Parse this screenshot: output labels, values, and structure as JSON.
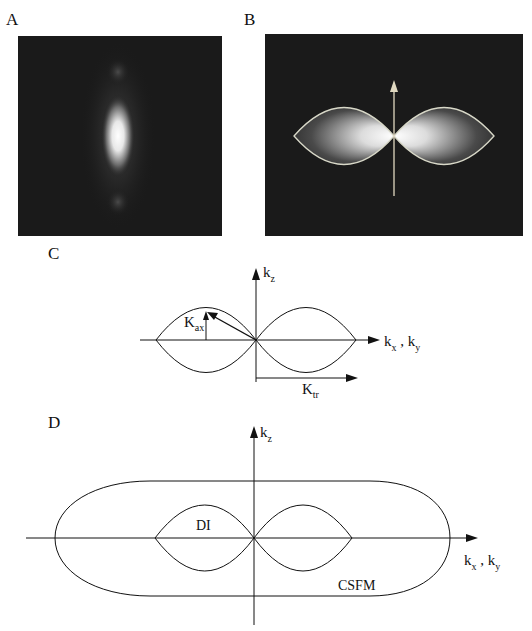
{
  "panels": {
    "A": {
      "label": "A",
      "description": "Point spread function image, vertically elongated bright spot on dark background"
    },
    "B": {
      "label": "B",
      "description": "Optical transfer function image with two lobes outlined, vertical arrow"
    },
    "C": {
      "label": "C",
      "axis_z": "k",
      "axis_z_sub": "z",
      "axis_x": "k",
      "axis_x_sub": "x",
      "axis_sep": " , ",
      "axis_y": "k",
      "axis_y_sub": "y",
      "kax": "K",
      "kax_sub": "ax",
      "ktr": "K",
      "ktr_sub": "tr"
    },
    "D": {
      "label": "D",
      "axis_z": "k",
      "axis_z_sub": "z",
      "axis_x": "k",
      "axis_x_sub": "x",
      "axis_sep": " , ",
      "axis_y": "k",
      "axis_y_sub": "y",
      "inner_label": "DI",
      "outer_label": "CSFM"
    }
  },
  "colors": {
    "image_bg": "#1a1a1a",
    "line": "#111111",
    "outline_B": "#d8d8c8"
  }
}
